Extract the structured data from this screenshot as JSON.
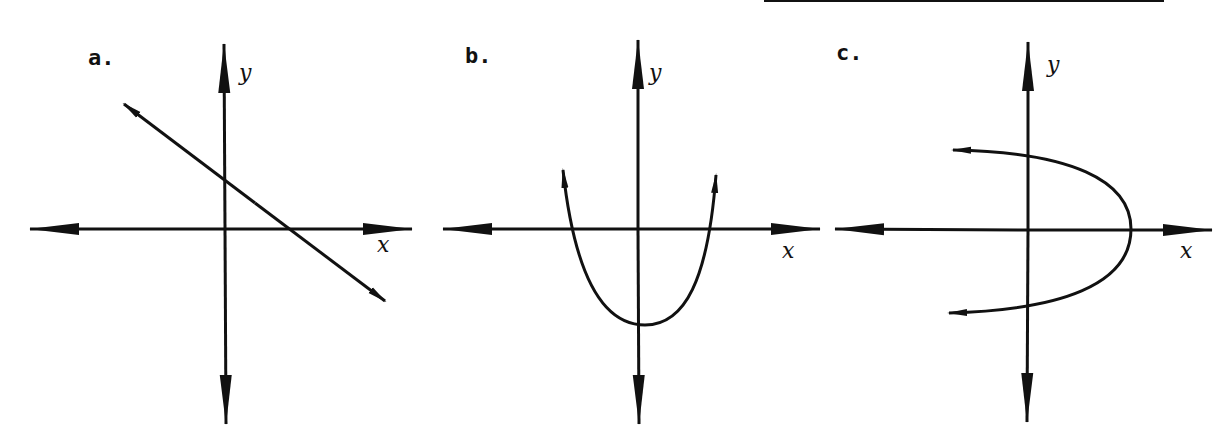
{
  "top_rule": {
    "x1": 764,
    "x2": 1164,
    "y": 1
  },
  "panels": [
    {
      "label": "a.",
      "x_axis_label": "x",
      "y_axis_label": "y",
      "curve": "line",
      "description": "Straight line with negative slope, crossing positive y-axis and positive x-axis"
    },
    {
      "label": "b.",
      "x_axis_label": "x",
      "y_axis_label": "y",
      "curve": "parabola-up",
      "description": "Upward-opening parabola with vertex below the origin on the y-axis"
    },
    {
      "label": "c.",
      "x_axis_label": "x",
      "y_axis_label": "y",
      "curve": "parabola-left",
      "description": "Left-opening parabola (sideways) with vertex on positive x-axis"
    }
  ]
}
